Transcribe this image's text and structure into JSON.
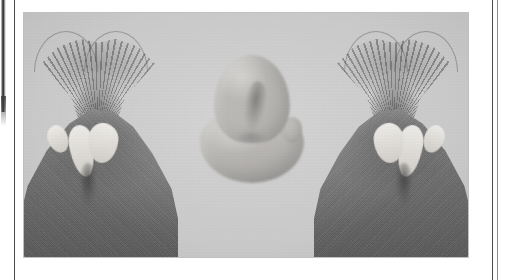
{
  "figure": {
    "kind": "scanned-photographic-plate",
    "caption": "",
    "label": "",
    "background_tone": "#c9c9c9",
    "plate": {
      "x": 24,
      "y": 13,
      "width": 444,
      "height": 244
    },
    "page": {
      "width": 511,
      "height": 280,
      "background": "#ffffff"
    },
    "rules": [
      {
        "name": "left-margin-rule",
        "x": 14,
        "color": "#4a4a4a"
      },
      {
        "name": "right-margin-rule",
        "x": 492,
        "color": "#4a4a4a"
      },
      {
        "name": "right-margin-rule-soft",
        "x": 497,
        "color": "#8e8e8e"
      }
    ],
    "artifacts": [
      {
        "name": "gutter-smear",
        "description": "dark scan smear along binding gutter"
      }
    ],
    "panels": [
      {
        "name": "left-specimen",
        "position": "left",
        "description": "anatomical specimen, dark wedge with pale central structures"
      },
      {
        "name": "center-specimen",
        "position": "center",
        "description": "isolated rounded bilobed specimen on plain ground"
      },
      {
        "name": "right-specimen",
        "position": "right",
        "description": "anatomical specimen, mirrored counterpart of the left"
      }
    ]
  }
}
